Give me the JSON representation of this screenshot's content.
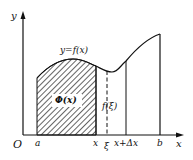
{
  "diagram": {
    "axes": {
      "x_label": "x",
      "y_label": "y",
      "origin_label": "O"
    },
    "curve_label": "y=f(x)",
    "area_label": "Φ(x)",
    "value_label": "f(ξ)",
    "tick_labels": {
      "a": "a",
      "x": "x",
      "xi": "ξ",
      "x_plus_dx": "x+Δx",
      "b": "b"
    },
    "colors": {
      "stroke": "#111111",
      "background": "#ffffff"
    }
  }
}
